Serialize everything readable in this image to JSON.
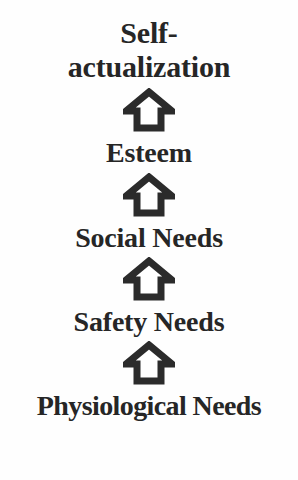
{
  "diagram": {
    "type": "hierarchy-ladder",
    "orientation": "vertical-ascending",
    "background_color": "#fefefe",
    "text_color": "#262626",
    "arrow_stroke_color": "#2b2b2b",
    "arrow_fill_color": "#ffffff",
    "levels": [
      {
        "id": "self-actualization",
        "label_line1": "Self-",
        "label_line2": "actualization",
        "label": "Self-actualization",
        "rank": 5
      },
      {
        "id": "esteem",
        "label": "Esteem",
        "rank": 4
      },
      {
        "id": "social-needs",
        "label": "Social Needs",
        "rank": 3
      },
      {
        "id": "safety-needs",
        "label": "Safety Needs",
        "rank": 2
      },
      {
        "id": "physiological-needs",
        "label": "Physiological Needs",
        "rank": 1
      }
    ],
    "arrows": [
      {
        "id": "arrow-physiological-to-safety",
        "direction": "up",
        "icon": "up-arrow-outline-icon"
      },
      {
        "id": "arrow-safety-to-social",
        "direction": "up",
        "icon": "up-arrow-outline-icon"
      },
      {
        "id": "arrow-social-to-esteem",
        "direction": "up",
        "icon": "up-arrow-outline-icon"
      },
      {
        "id": "arrow-esteem-to-self-actualization",
        "direction": "up",
        "icon": "up-arrow-outline-icon"
      }
    ]
  }
}
